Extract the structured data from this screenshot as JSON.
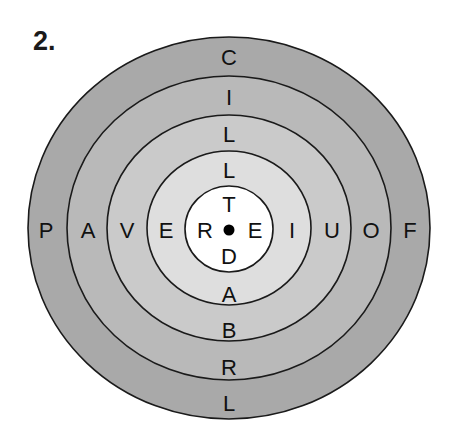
{
  "puzzle": {
    "number_label": "2."
  },
  "target": {
    "center": {
      "x": 229,
      "y": 229
    },
    "rings": [
      {
        "name": "ring-1-outer",
        "rx": 201,
        "ry": 192,
        "fill": "#a9a9a9"
      },
      {
        "name": "ring-2",
        "rx": 162,
        "ry": 153,
        "fill": "#b9b9b9"
      },
      {
        "name": "ring-3",
        "rx": 122,
        "ry": 114,
        "fill": "#cacaca"
      },
      {
        "name": "ring-4",
        "rx": 82,
        "ry": 77,
        "fill": "#dedede"
      },
      {
        "name": "center-circle",
        "rx": 44,
        "ry": 43,
        "fill": "#ffffff"
      }
    ],
    "stroke_color": "#1a1a1a",
    "bullseye_color": "#000000",
    "letters": {
      "top": [
        "C",
        "I",
        "L",
        "L",
        "T"
      ],
      "left": [
        "P",
        "A",
        "V",
        "E",
        "R"
      ],
      "right": [
        "F",
        "O",
        "U",
        "I",
        "E"
      ],
      "bottom": [
        "L",
        "R",
        "B",
        "A",
        "D"
      ]
    }
  }
}
